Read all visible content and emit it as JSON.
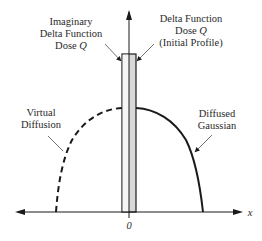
{
  "diagram": {
    "type": "schematic",
    "labels": {
      "imaginary_delta": {
        "line1": "Imaginary",
        "line2": "Delta Function",
        "line3_prefix": "Dose ",
        "line3_var": "Q"
      },
      "delta_function": {
        "line1": "Delta Function",
        "line2_prefix": "Dose ",
        "line2_var": "Q",
        "line3": "(Initial Profile)"
      },
      "virtual_diffusion": {
        "line1": "Virtual",
        "line2": "Diffusion"
      },
      "diffused_gaussian": {
        "line1": "Diffused",
        "line2": "Gaussian"
      },
      "x_axis_label": "x",
      "origin_label": "0"
    },
    "colors": {
      "line": "#1a1a1a",
      "bar_fill": "#d8d8d8",
      "text": "#2a2a2a"
    }
  }
}
